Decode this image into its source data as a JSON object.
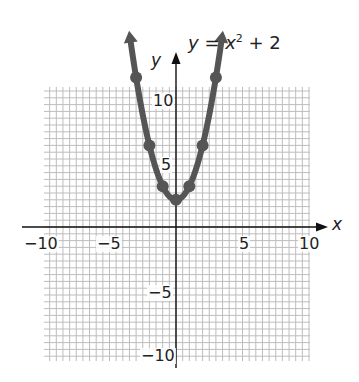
{
  "chart_data": {
    "type": "line",
    "title_parts": {
      "lhs": "y",
      "eq": " = ",
      "var": "x",
      "exp": "2",
      "rest": " + 2"
    },
    "xlabel": "x",
    "ylabel": "y",
    "xlim": [
      -10,
      10
    ],
    "ylim": [
      -10,
      10
    ],
    "grid": true,
    "x_ticks": [
      -10,
      -5,
      5,
      10
    ],
    "y_ticks": [
      10,
      5,
      -5,
      -10
    ],
    "x_tick_labels": [
      "−10",
      "−5",
      "5",
      "10"
    ],
    "y_tick_labels": [
      "10",
      "5",
      "−5",
      "−10"
    ],
    "series": [
      {
        "name": "y = x^2 + 2",
        "color": "#555555",
        "points": [
          {
            "x": -3,
            "y": 11
          },
          {
            "x": -2,
            "y": 6
          },
          {
            "x": -1,
            "y": 3
          },
          {
            "x": 0,
            "y": 2
          },
          {
            "x": 1,
            "y": 3
          },
          {
            "x": 2,
            "y": 6
          },
          {
            "x": 3,
            "y": 11
          }
        ],
        "arrows_at_ends": true
      }
    ]
  },
  "colors": {
    "grid": "#bdbdbd",
    "axis": "#111111",
    "curve": "#555555"
  }
}
